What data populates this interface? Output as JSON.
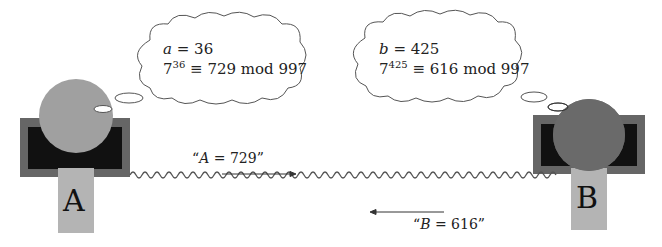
{
  "diagram": {
    "alice": {
      "label": "A",
      "secret_var": "a",
      "secret_value": "36",
      "base": "7",
      "exponent": "36",
      "result": "729",
      "modulus_text": "mod 997",
      "equals": "=",
      "congruent": "≡",
      "colors": {
        "head": "#a0a0a0",
        "body": "#b4b4b4",
        "frame": "#666666",
        "screen": "#111111"
      }
    },
    "bob": {
      "label": "B",
      "secret_var": "b",
      "secret_value": "425",
      "base": "7",
      "exponent": "425",
      "result": "616",
      "modulus_text": "mod 997",
      "equals": "=",
      "congruent": "≡",
      "colors": {
        "head": "#6a6a6a",
        "body": "#b4b4b4",
        "frame": "#666666",
        "screen": "#111111"
      }
    },
    "messages": [
      {
        "open": "“",
        "var": "A",
        "eq": " = ",
        "value": "729",
        "close": "”",
        "direction": "right"
      },
      {
        "open": "“",
        "var": "B",
        "eq": " = ",
        "value": "616",
        "close": "”",
        "direction": "left"
      }
    ],
    "channel": {
      "style": "wavy-line",
      "color": "#555555"
    }
  }
}
